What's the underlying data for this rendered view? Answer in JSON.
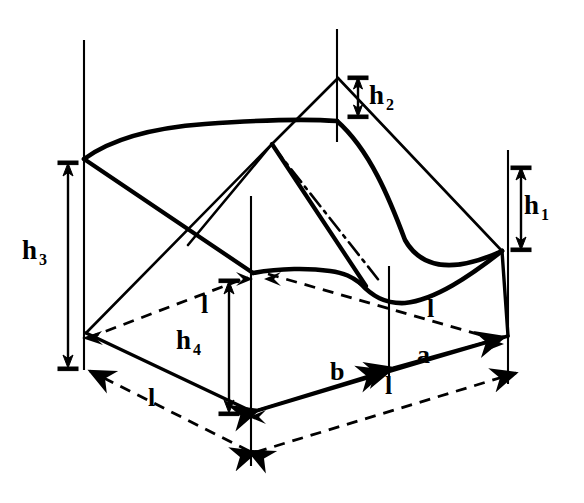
{
  "figure": {
    "stroke_color": "#000000",
    "background_color": "#ffffff",
    "width": 584,
    "height": 503
  },
  "labels": {
    "h1": {
      "base": "h",
      "sub": "1",
      "x": 524,
      "y": 192
    },
    "h2": {
      "base": "h",
      "sub": "2",
      "x": 369,
      "y": 82
    },
    "h3": {
      "base": "h",
      "sub": "3",
      "x": 22,
      "y": 237
    },
    "h4": {
      "base": "h",
      "sub": "4",
      "x": 176,
      "y": 327
    },
    "l_mid_left": {
      "base": "l",
      "sub": "",
      "x": 201,
      "y": 292
    },
    "l_mid_right": {
      "base": "l",
      "sub": "",
      "x": 427,
      "y": 296
    },
    "l_bottom_left": {
      "base": "l",
      "sub": "",
      "x": 148,
      "y": 385
    },
    "l_bottom_right": {
      "base": "l",
      "sub": "",
      "x": 385,
      "y": 373
    },
    "a": {
      "base": "a",
      "sub": "",
      "x": 417,
      "y": 342
    },
    "b": {
      "base": "b",
      "sub": "",
      "x": 330,
      "y": 359
    }
  },
  "dimensions": [
    {
      "name": "h1",
      "orientation": "vertical",
      "x": 521,
      "y_top": 168,
      "y_bottom": 246
    },
    {
      "name": "h2",
      "orientation": "vertical",
      "x": 358,
      "y_top": 78,
      "y_bottom": 116
    },
    {
      "name": "h3",
      "orientation": "vertical",
      "x": 68,
      "y_top": 163,
      "y_bottom": 367
    },
    {
      "name": "h4",
      "orientation": "vertical",
      "x": 229,
      "y_top": 281,
      "y_bottom": 412
    },
    {
      "name": "l_bottom_left",
      "orientation": "diagonal",
      "x1": 86,
      "y1": 369,
      "x2": 249,
      "y2": 451
    },
    {
      "name": "l_bottom_right",
      "orientation": "diagonal",
      "x1": 253,
      "y1": 451,
      "x2": 519,
      "y2": 371
    },
    {
      "name": "l_mid_left",
      "orientation": "diagonal",
      "x1": 88,
      "y1": 338,
      "x2": 244,
      "y2": 277
    },
    {
      "name": "l_mid_right",
      "orientation": "diagonal",
      "x1": 272,
      "y1": 272,
      "x2": 503,
      "y2": 341
    },
    {
      "name": "a",
      "orientation": "diagonal",
      "x1": 389,
      "y1": 369,
      "x2": 508,
      "y2": 336
    },
    {
      "name": "b",
      "orientation": "diagonal",
      "x1": 254,
      "y1": 412,
      "x2": 385,
      "y2": 371
    }
  ],
  "geometry": {
    "vertices": {
      "top_peak_back": {
        "x": 338,
        "y": 77
      },
      "top_left": {
        "x": 84,
        "y": 159
      },
      "top_right": {
        "x": 502,
        "y": 251
      },
      "saddle_center": {
        "x": 272,
        "y": 144
      },
      "curve_peak": {
        "x": 337,
        "y": 121
      },
      "front_low": {
        "x": 253,
        "y": 273
      },
      "base_left": {
        "x": 86,
        "y": 333
      },
      "base_front": {
        "x": 253,
        "y": 412
      },
      "base_right": {
        "x": 508,
        "y": 336
      }
    },
    "verticals": [
      {
        "name": "left-post",
        "x": 84,
        "y_top": 40,
        "y_bottom": 370
      },
      {
        "name": "center-post",
        "x": 251,
        "y_top": 195,
        "y_bottom": 465
      },
      {
        "name": "peak-post",
        "x": 337,
        "y_top": 30,
        "y_bottom": 140
      },
      {
        "name": "mid-right-post",
        "x": 389,
        "y_top": 267,
        "y_bottom": 378
      },
      {
        "name": "right-post",
        "x": 508,
        "y_top": 150,
        "y_bottom": 383
      }
    ]
  }
}
